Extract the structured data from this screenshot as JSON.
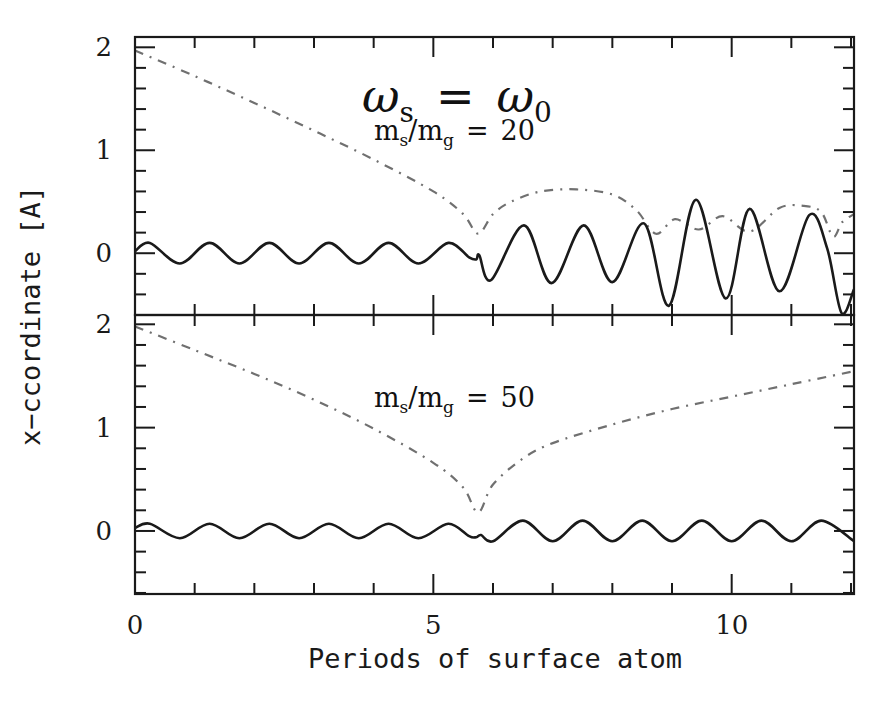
{
  "page_header_fragment": "",
  "chart_data": {
    "type": "line",
    "xlabel": "Periods of surface atom",
    "ylabel": "x−ccordinate [A]",
    "xlim": [
      0,
      12.05
    ],
    "x_ticks_major": [
      0,
      5,
      10
    ],
    "x_tick_labels": [
      "0",
      "5",
      "10"
    ],
    "x_ticks_minor_step": 1,
    "grid": false,
    "legend": null,
    "panels": [
      {
        "id": "top",
        "title": "ωs = ω0",
        "title_parts": {
          "lhs": "ω",
          "lhs_sub": "s",
          "eq": "=",
          "rhs": "ω",
          "rhs_sub": "0"
        },
        "annotation": {
          "lhs": "m",
          "lhs_sub": "s",
          "slash": "/",
          "rhs": "m",
          "rhs_sub": "g",
          "eq": "=",
          "value": "20"
        },
        "mass_ratio": 20,
        "ylim": [
          -0.6,
          2.1
        ],
        "y_ticks_major": [
          0,
          1,
          2
        ],
        "y_tick_labels": [
          "0",
          "1",
          "2"
        ],
        "y_ticks_minor_step": 0.2,
        "series": [
          {
            "name": "dash-dot (envelope)",
            "style": "dash-dot",
            "x": [
              0.0,
              1.0,
              2.0,
              3.0,
              4.0,
              5.0,
              5.5,
              5.75,
              6.0,
              6.3,
              6.8,
              7.4,
              8.0,
              8.4,
              8.73,
              9.05,
              9.45,
              9.85,
              10.3,
              10.8,
              11.2,
              11.5,
              11.7,
              11.85,
              12.05
            ],
            "y": [
              1.97,
              1.72,
              1.46,
              1.19,
              0.91,
              0.6,
              0.38,
              0.19,
              0.38,
              0.5,
              0.6,
              0.62,
              0.57,
              0.42,
              0.19,
              0.33,
              0.23,
              0.36,
              0.21,
              0.44,
              0.46,
              0.4,
              0.16,
              0.3,
              0.38
            ]
          },
          {
            "name": "solid (particle)",
            "style": "solid",
            "x": [
              0.0,
              0.25,
              0.75,
              1.25,
              1.75,
              2.25,
              2.75,
              3.25,
              3.75,
              4.25,
              4.75,
              5.25,
              5.6,
              5.72,
              5.77,
              5.97,
              6.52,
              6.98,
              7.52,
              8.0,
              8.53,
              8.95,
              9.4,
              9.9,
              10.3,
              10.8,
              11.3,
              11.6,
              11.84,
              12.05
            ],
            "y": [
              0.02,
              0.1,
              -0.1,
              0.1,
              -0.1,
              0.1,
              -0.1,
              0.1,
              -0.1,
              0.1,
              -0.1,
              0.1,
              -0.04,
              -0.06,
              -0.02,
              -0.26,
              0.27,
              -0.29,
              0.27,
              -0.28,
              0.29,
              -0.51,
              0.52,
              -0.44,
              0.43,
              -0.37,
              0.37,
              0.05,
              -0.58,
              -0.35
            ]
          }
        ]
      },
      {
        "id": "bottom",
        "annotation": {
          "lhs": "m",
          "lhs_sub": "s",
          "slash": "/",
          "rhs": "m",
          "rhs_sub": "g",
          "eq": "=",
          "value": "50"
        },
        "mass_ratio": 50,
        "ylim": [
          -0.61,
          2.09
        ],
        "y_ticks_major": [
          0,
          1,
          2
        ],
        "y_tick_labels": [
          "0",
          "1",
          "2"
        ],
        "y_ticks_minor_step": 0.2,
        "series": [
          {
            "name": "dash-dot (envelope)",
            "style": "dash-dot",
            "x": [
              0.0,
              1.0,
              2.0,
              3.0,
              4.0,
              5.0,
              5.5,
              5.75,
              6.0,
              6.5,
              7.0,
              8.0,
              9.0,
              10.0,
              11.0,
              12.0
            ],
            "y": [
              1.98,
              1.75,
              1.52,
              1.27,
              0.99,
              0.66,
              0.42,
              0.18,
              0.45,
              0.7,
              0.85,
              1.03,
              1.18,
              1.3,
              1.42,
              1.54
            ]
          },
          {
            "name": "solid (particle)",
            "style": "solid",
            "x": [
              0.0,
              0.25,
              0.75,
              1.25,
              1.75,
              2.25,
              2.75,
              3.25,
              3.75,
              4.25,
              4.75,
              5.25,
              5.6,
              5.72,
              5.8,
              6.0,
              6.5,
              7.0,
              7.5,
              8.0,
              8.5,
              9.0,
              9.5,
              10.0,
              10.5,
              11.0,
              11.5,
              12.05
            ],
            "y": [
              0.03,
              0.07,
              -0.07,
              0.07,
              -0.07,
              0.07,
              -0.07,
              0.07,
              -0.07,
              0.07,
              -0.07,
              0.07,
              -0.05,
              -0.06,
              -0.04,
              -0.1,
              0.1,
              -0.1,
              0.1,
              -0.1,
              0.1,
              -0.1,
              0.1,
              -0.1,
              0.1,
              -0.1,
              0.1,
              -0.1
            ]
          }
        ]
      }
    ]
  }
}
